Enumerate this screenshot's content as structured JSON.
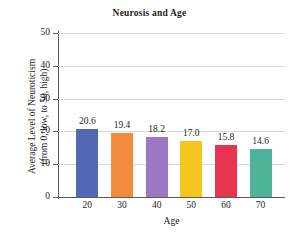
{
  "chart_data": {
    "type": "bar",
    "title": "Neurosis and Age",
    "xlabel": "Age",
    "ylabel_line1": "Average Level of Neuroticism",
    "ylabel_line2": "(from 0, low, to 50, high)",
    "categories": [
      "20",
      "30",
      "40",
      "50",
      "60",
      "70"
    ],
    "values": [
      20.6,
      19.4,
      18.2,
      17.0,
      15.8,
      14.6
    ],
    "value_labels": [
      "20.6",
      "19.4",
      "18.2",
      "17.0",
      "15.8",
      "14.6"
    ],
    "bar_colors": [
      "#5268b4",
      "#f18c3e",
      "#9b77c4",
      "#f4c71e",
      "#e8344e",
      "#4fb39a"
    ],
    "ylim": [
      0,
      50
    ],
    "yticks": [
      0,
      10,
      20,
      30,
      40,
      50
    ],
    "ytick_labels": [
      "0",
      "10",
      "20",
      "30",
      "40",
      "50"
    ],
    "grid": true,
    "legend": "none",
    "axis_color": "#5a5a5a",
    "grid_color": "#d8d8d8",
    "background": "#ffffff"
  }
}
